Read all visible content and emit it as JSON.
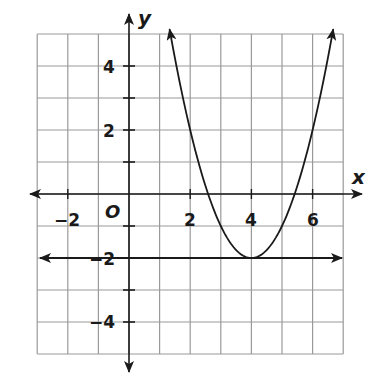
{
  "chart_data": {
    "type": "line",
    "title": "",
    "xlabel": "x",
    "ylabel": "y",
    "origin_label": "O",
    "xlim": [
      -3,
      7
    ],
    "ylim": [
      -5,
      5
    ],
    "grid": true,
    "x_tick_labels": [
      {
        "value": -2,
        "label": "−2"
      },
      {
        "value": 2,
        "label": "2"
      },
      {
        "value": 4,
        "label": "4"
      },
      {
        "value": 6,
        "label": "6"
      }
    ],
    "y_tick_labels": [
      {
        "value": 4,
        "label": "4"
      },
      {
        "value": 2,
        "label": "2"
      },
      {
        "value": -2,
        "label": "−2"
      },
      {
        "value": -4,
        "label": "−4"
      }
    ],
    "series": [
      {
        "name": "parabola",
        "equation": "y = (x - 4)^2 - 2",
        "vertex": [
          4,
          -2
        ],
        "x_intercepts": [
          2.59,
          5.41
        ],
        "x": [
          1.35,
          2,
          2.59,
          3,
          4,
          5,
          5.41,
          6,
          6.65
        ],
        "y": [
          5,
          2,
          0,
          -1,
          -2,
          -1,
          0,
          2,
          5
        ],
        "arrows": "both ends"
      },
      {
        "name": "horizontal line",
        "equation": "y = -2",
        "x": [
          -3,
          7
        ],
        "y": [
          -2,
          -2
        ],
        "arrows": "both ends"
      }
    ]
  }
}
